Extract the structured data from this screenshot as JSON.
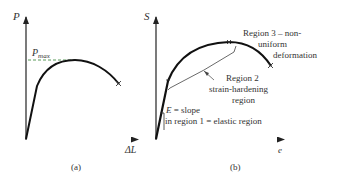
{
  "panel_a": {
    "y_axis_label": "P",
    "x_axis_label": "ΔL",
    "pmax_label_main": "P",
    "pmax_label_sub": "max",
    "caption": "(a)"
  },
  "panel_b": {
    "y_axis_label": "S",
    "x_axis_label": "e",
    "caption": "(b)",
    "region3_line1": "Region 3 – non-",
    "region3_line2": "uniform",
    "region3_line3": "deformation",
    "region2_line1": "Region 2",
    "region2_line2": "strain-hardening",
    "region2_line3": "region",
    "region1_line1_symbol": "E",
    "region1_line1_rest": " = slope",
    "region1_line2": "in region 1 = elastic region"
  },
  "colors": {
    "curve": "#111111",
    "axis": "#222222",
    "pmax_dash": "#5a9a5a",
    "e_axis_tint": "#c05060"
  }
}
